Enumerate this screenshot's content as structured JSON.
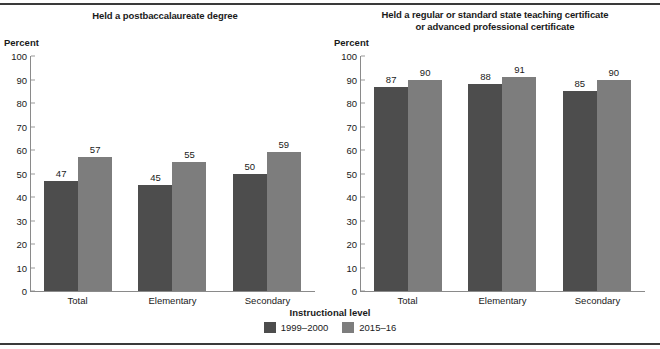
{
  "figure": {
    "xaxis_title": "Instructional level",
    "yaxis_unit_label": "Percent"
  },
  "legend": {
    "items": [
      {
        "label": "1999–2000",
        "color": "#4d4d4d",
        "swatch_icon": "legend-swatch-icon"
      },
      {
        "label": "2015–16",
        "color": "#7d7d7d",
        "swatch_icon": "legend-swatch-icon"
      }
    ]
  },
  "panels": [
    {
      "title_line1": "Held a postbaccalaureate degree",
      "title_line2": ""
    },
    {
      "title_line1": "Held a regular or standard state teaching certificate",
      "title_line2": "or advanced professional certificate"
    }
  ],
  "yticks": [
    "100",
    "90",
    "80",
    "70",
    "60",
    "50",
    "40",
    "30",
    "20",
    "10",
    "0"
  ],
  "chart_data": [
    {
      "type": "bar",
      "title": "Held a postbaccalaureate degree",
      "xlabel": "Instructional level",
      "ylabel": "Percent",
      "ylim": [
        0,
        100
      ],
      "ytick_step": 10,
      "grid": false,
      "legend_position": "bottom-center",
      "categories": [
        "Total",
        "Elementary",
        "Secondary"
      ],
      "series": [
        {
          "name": "1999–2000",
          "color": "#4d4d4d",
          "values": [
            47,
            45,
            50
          ]
        },
        {
          "name": "2015–16",
          "color": "#7d7d7d",
          "values": [
            57,
            55,
            59
          ]
        }
      ]
    },
    {
      "type": "bar",
      "title": "Held a regular or standard state teaching certificate or advanced professional certificate",
      "xlabel": "Instructional level",
      "ylabel": "Percent",
      "ylim": [
        0,
        100
      ],
      "ytick_step": 10,
      "grid": false,
      "legend_position": "bottom-center",
      "categories": [
        "Total",
        "Elementary",
        "Secondary"
      ],
      "series": [
        {
          "name": "1999–2000",
          "color": "#4d4d4d",
          "values": [
            87,
            88,
            85
          ]
        },
        {
          "name": "2015–16",
          "color": "#7d7d7d",
          "values": [
            90,
            91,
            90
          ]
        }
      ]
    }
  ]
}
